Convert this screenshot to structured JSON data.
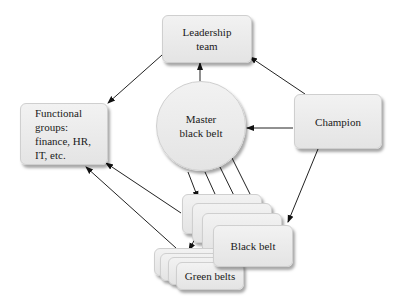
{
  "nodes": {
    "leadership": {
      "label": "Leadership\nteam"
    },
    "functional": {
      "label": "Functional\ngroups:\nfinance, HR,\nIT, etc."
    },
    "master": {
      "label": "Master\nblack belt"
    },
    "champion": {
      "label": "Champion"
    },
    "black_belt": {
      "label": "Black belt"
    },
    "green_belts": {
      "label": "Green belts"
    }
  },
  "edges": [
    {
      "from": "leadership",
      "to": "functional"
    },
    {
      "from": "master",
      "to": "leadership"
    },
    {
      "from": "champion",
      "to": "leadership"
    },
    {
      "from": "champion",
      "to": "master"
    },
    {
      "from": "champion",
      "to": "black_belt"
    },
    {
      "from": "master",
      "to": "black_belt",
      "count": 4
    },
    {
      "from": "black_belt",
      "to": "functional"
    },
    {
      "from": "green_belts",
      "to": "functional"
    },
    {
      "from": "black_belt",
      "to": "green_belts",
      "count": 3
    }
  ]
}
